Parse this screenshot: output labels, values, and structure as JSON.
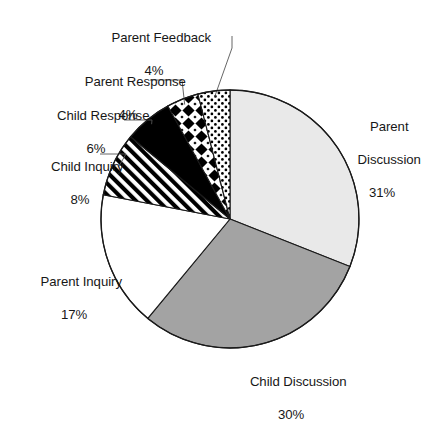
{
  "chart_data": {
    "type": "pie",
    "title": "",
    "subtitle": "",
    "xlabel": "",
    "ylabel": "",
    "legend_position": "none",
    "grid": false,
    "labels_show_percent": true,
    "start_angle_deg": 0,
    "direction": "clockwise",
    "categories": [
      "Parent Discussion",
      "Child Discussion",
      "Parent Inquiry",
      "Child Inquiry",
      "Child Response",
      "Parent Response",
      "Parent Feedback"
    ],
    "values": [
      31,
      30,
      17,
      8,
      6,
      4,
      4
    ],
    "value_labels": [
      "31%",
      "30%",
      "17%",
      "8%",
      "6%",
      "4%",
      "4%"
    ],
    "slices": [
      {
        "name": "Parent Discussion",
        "label": "Parent Discussion",
        "label_line1": "Parent",
        "label_line2": "Discussion",
        "value": 31,
        "percent": "31%",
        "fill": "#e9e9e9",
        "pattern": "solid-light-gray",
        "start_deg": 0,
        "end_deg": 111.6,
        "leader": false
      },
      {
        "name": "Child Discussion",
        "label": "Child Discussion",
        "label_line1": "Child Discussion",
        "label_line2": "",
        "value": 30,
        "percent": "30%",
        "fill": "#a3a3a3",
        "pattern": "solid-medium-gray",
        "start_deg": 111.6,
        "end_deg": 219.6,
        "leader": false
      },
      {
        "name": "Parent Inquiry",
        "label": "Parent Inquiry",
        "label_line1": "Parent Inquiry",
        "label_line2": "",
        "value": 17,
        "percent": "17%",
        "fill": "#ffffff",
        "pattern": "solid-white",
        "start_deg": 219.6,
        "end_deg": 280.8,
        "leader": false
      },
      {
        "name": "Child Inquiry",
        "label": "Child Inquiry",
        "label_line1": "Child Inquiry",
        "label_line2": "",
        "value": 8,
        "percent": "8%",
        "fill": "#000000",
        "pattern": "diagonal-stripes",
        "start_deg": 280.8,
        "end_deg": 309.6,
        "leader": true
      },
      {
        "name": "Child Response",
        "label": "Child Response",
        "label_line1": "Child Response",
        "label_line2": "",
        "value": 6,
        "percent": "6%",
        "fill": "#000000",
        "pattern": "solid-black",
        "start_deg": 309.6,
        "end_deg": 331.2,
        "leader": true
      },
      {
        "name": "Parent Response",
        "label": "Parent Response",
        "label_line1": "Parent Response",
        "label_line2": "",
        "value": 4,
        "percent": "4%",
        "fill": "#000000",
        "pattern": "checkered-diamonds",
        "start_deg": 331.2,
        "end_deg": 345.6,
        "leader": true
      },
      {
        "name": "Parent Feedback",
        "label": "Parent Feedback",
        "label_line1": "Parent Feedback",
        "label_line2": "",
        "value": 4,
        "percent": "4%",
        "fill": "#000000",
        "pattern": "fine-dots",
        "start_deg": 345.6,
        "end_deg": 360,
        "leader": true
      }
    ],
    "geometry": {
      "center_x": 230,
      "center_y": 219,
      "radius": 129
    },
    "colors": {
      "outline": "#1a1a1a",
      "background": "#ffffff",
      "text": "#171717",
      "leader_line": "#555555",
      "parent_discussion": "#e9e9e9",
      "child_discussion": "#a3a3a3",
      "parent_inquiry": "#ffffff",
      "pattern_ink": "#000000"
    }
  }
}
